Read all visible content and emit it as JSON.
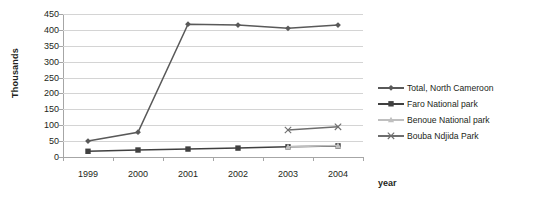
{
  "chart_data": {
    "type": "line",
    "title": "",
    "subtitle": "",
    "xlabel": "year",
    "ylabel": "Thousands",
    "categories": [
      "1999",
      "2000",
      "2001",
      "2002",
      "2003",
      "2004"
    ],
    "x": [
      1999,
      2000,
      2001,
      2002,
      2003,
      2004
    ],
    "ylim": [
      0,
      450
    ],
    "yticks": [
      0,
      50,
      100,
      150,
      200,
      250,
      300,
      350,
      400,
      450
    ],
    "ytick_labels": [
      "0",
      "50",
      "100",
      "150",
      "200",
      "250",
      "300",
      "350",
      "400",
      "450"
    ],
    "grid": "horizontal",
    "legend_position": "right",
    "series": [
      {
        "name": "Total, North Cameroon",
        "marker": "diamond",
        "color": "#595959",
        "values": [
          50,
          78,
          418,
          415,
          405,
          415
        ]
      },
      {
        "name": "Faro National park",
        "marker": "square",
        "color": "#404040",
        "values": [
          18,
          22,
          25,
          28,
          32,
          35
        ]
      },
      {
        "name": "Benoue National park",
        "marker": "triangle",
        "color": "#bfbfbf",
        "values": [
          null,
          null,
          null,
          null,
          32,
          36
        ]
      },
      {
        "name": "Bouba Ndjida Park",
        "marker": "cross",
        "color": "#6e6e6e",
        "values": [
          null,
          null,
          null,
          null,
          85,
          95
        ]
      }
    ]
  },
  "axis": {
    "ylabel": "Thousands",
    "xlabel": "year"
  },
  "legend": {
    "items": [
      {
        "label": "Total, North Cameroon"
      },
      {
        "label": "Faro National park"
      },
      {
        "label": "Benoue National park"
      },
      {
        "label": "Bouba Ndjida Park"
      }
    ]
  }
}
